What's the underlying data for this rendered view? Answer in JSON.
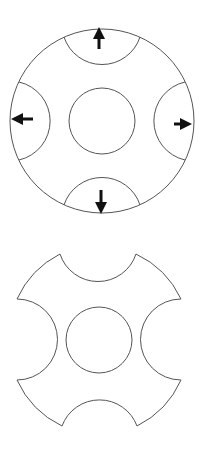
{
  "diagram": {
    "title": "",
    "colors": {
      "background": "#ffffff",
      "outline": "#555555",
      "arrow": "#111111"
    },
    "figure_top": {
      "description": "Circle with four edge semicircular regions and arrows pointing outward",
      "outer_circle": {
        "cx": 102,
        "cy": 121,
        "r": 92
      },
      "inner_circle": {
        "cx": 102,
        "cy": 121,
        "r": 33
      },
      "notches": [
        {
          "name": "top",
          "cx": 102,
          "cy": 26,
          "r": 40,
          "arrow": "up"
        },
        {
          "name": "right",
          "cx": 195,
          "cy": 121,
          "r": 40,
          "arrow": "right"
        },
        {
          "name": "bottom",
          "cx": 102,
          "cy": 216,
          "r": 40,
          "arrow": "down"
        },
        {
          "name": "left",
          "cx": 9,
          "cy": 121,
          "r": 40,
          "arrow": "left"
        }
      ]
    },
    "figure_bottom": {
      "description": "Resulting shape with four notches removed and central circle",
      "center": {
        "cx": 99,
        "cy": 340
      },
      "outer_r": 94,
      "notch_r": 40,
      "inner_circle": {
        "cx": 99,
        "cy": 340,
        "r": 33
      }
    }
  }
}
